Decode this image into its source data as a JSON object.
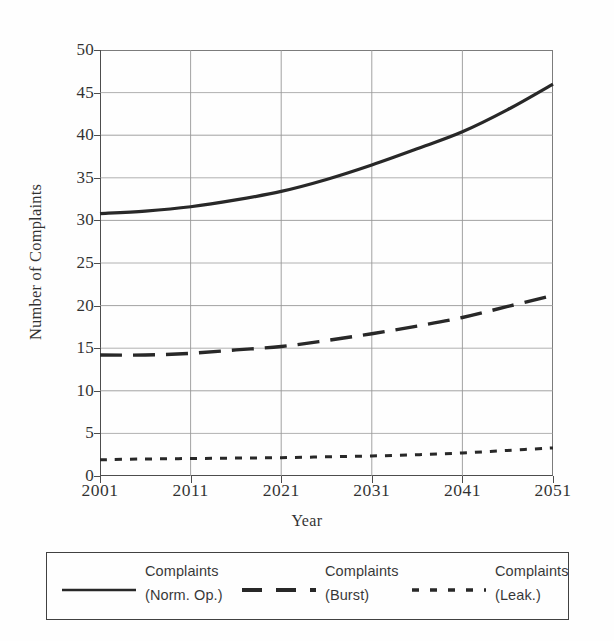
{
  "chart_data": {
    "type": "line",
    "title": "",
    "xlabel": "Year",
    "ylabel": "Number of Complaints",
    "xlim": [
      2001,
      2051
    ],
    "ylim": [
      0,
      50
    ],
    "grid": true,
    "legend_position": "bottom",
    "x_ticks": [
      "2001",
      "2011",
      "2021",
      "2031",
      "2041",
      "2051"
    ],
    "x_tick_values": [
      2001,
      2011,
      2021,
      2031,
      2041,
      2051
    ],
    "y_ticks": [
      "0",
      "5",
      "10",
      "15",
      "20",
      "25",
      "30",
      "35",
      "40",
      "45",
      "50"
    ],
    "y_tick_values": [
      0,
      5,
      10,
      15,
      20,
      25,
      30,
      35,
      40,
      45,
      50
    ],
    "x": [
      2001,
      2006,
      2011,
      2016,
      2021,
      2026,
      2031,
      2036,
      2041,
      2046,
      2051
    ],
    "series": [
      {
        "name": "Complaints (Norm. Op.)",
        "label_line1": "Complaints",
        "label_line2": "(Norm. Op.)",
        "style": "solid",
        "color": "#111111",
        "width": 3.2,
        "values": [
          30.8,
          31.1,
          31.6,
          32.4,
          33.4,
          34.8,
          36.5,
          38.4,
          40.4,
          43.0,
          46.0
        ]
      },
      {
        "name": "Complaints (Burst)",
        "label_line1": "Complaints",
        "label_line2": "(Burst)",
        "style": "dashed",
        "color": "#111111",
        "width": 3.4,
        "values": [
          14.2,
          14.2,
          14.4,
          14.8,
          15.2,
          15.9,
          16.7,
          17.6,
          18.6,
          19.9,
          21.2
        ]
      },
      {
        "name": "Complaints (Leak.)",
        "label_line1": "Complaints",
        "label_line2": "(Leak.)",
        "style": "dotted",
        "color": "#111111",
        "width": 3.0,
        "values": [
          1.9,
          2.0,
          2.05,
          2.1,
          2.15,
          2.25,
          2.35,
          2.5,
          2.7,
          3.0,
          3.3
        ]
      }
    ]
  },
  "colors": {
    "axis": "#3a3a3a",
    "grid": "#8d8d8d",
    "ink": "#111111",
    "background": "#ffffff"
  }
}
